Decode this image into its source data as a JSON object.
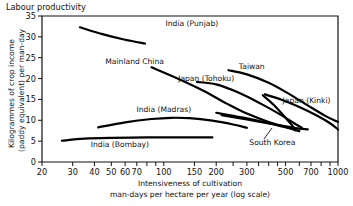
{
  "figure": {
    "top_title": "Labour productivity"
  },
  "chart_data": {
    "type": "line",
    "title": "Labour productivity",
    "xlabel": "Intensiveness of cultivation man-days per hectare per year (log scale)",
    "xlabel_line1": "Intensiveness of cultivation",
    "xlabel_line2": "man-days per hectare per year (log scale)",
    "ylabel": "Kilogrammes of crop income (paddy equivalent) per man-day",
    "ylabel_line1": "Kilogrammes of crop income",
    "ylabel_line2": "(paddy equivalent) per man-day",
    "xscale": "log",
    "xlim": [
      20,
      1000
    ],
    "ylim": [
      0,
      35
    ],
    "grid": false,
    "legend": "inline-labels",
    "xticks": [
      20,
      30,
      40,
      50,
      60,
      70,
      100,
      150,
      200,
      300,
      500,
      700,
      1000
    ],
    "xtick_labels": [
      "20",
      "30",
      "40",
      "50",
      "60",
      "70",
      "100",
      "150",
      "200",
      "300",
      "500",
      "700",
      "1000"
    ],
    "xminor_ticks": [
      80,
      90,
      250,
      350,
      400,
      450,
      600,
      800,
      900
    ],
    "yticks": [
      0,
      5,
      10,
      15,
      20,
      25,
      30,
      35
    ],
    "ytick_labels": [
      "0",
      "5",
      "10",
      "15",
      "20",
      "25",
      "30",
      "35"
    ],
    "series": [
      {
        "name": "India (Punjab)",
        "label": "India (Punjab)",
        "label_x": 145,
        "label_y": 32.5,
        "points": [
          [
            33,
            32.3
          ],
          [
            45,
            30.6
          ],
          [
            60,
            29.3
          ],
          [
            78,
            28.4
          ]
        ]
      },
      {
        "name": "Mainland China",
        "label": "Mainland China",
        "label_x": 68,
        "label_y": 23.4,
        "points": [
          [
            85,
            22.7
          ],
          [
            120,
            20.0
          ],
          [
            170,
            17.0
          ],
          [
            230,
            14.0
          ],
          [
            300,
            11.6
          ],
          [
            400,
            9.6
          ],
          [
            520,
            8.2
          ],
          [
            600,
            7.4
          ]
        ]
      },
      {
        "name": "Japan (Tohoku)",
        "label": "Japan (Tohoku)",
        "label_x": 175,
        "label_y": 19.5,
        "points": [
          [
            155,
            19.2
          ],
          [
            200,
            18.6
          ],
          [
            270,
            16.6
          ],
          [
            360,
            14.0
          ],
          [
            470,
            11.3
          ],
          [
            560,
            9.3
          ],
          [
            620,
            8.2
          ]
        ]
      },
      {
        "name": "Taiwan",
        "label": "Taiwan",
        "label_x": 320,
        "label_y": 22.4,
        "points": [
          [
            235,
            22.0
          ],
          [
            300,
            21.0
          ],
          [
            400,
            19.0
          ],
          [
            520,
            16.4
          ],
          [
            680,
            13.4
          ],
          [
            850,
            11.0
          ],
          [
            1000,
            9.6
          ]
        ]
      },
      {
        "name": "Japan (Kinki)",
        "label": "Japan (Kinki)",
        "label_x": 660,
        "label_y": 14.2,
        "points": [
          [
            380,
            16.2
          ],
          [
            470,
            15.0
          ],
          [
            600,
            13.2
          ],
          [
            760,
            11.1
          ],
          [
            900,
            9.3
          ],
          [
            1000,
            7.8
          ]
        ]
      },
      {
        "name": "South Korea",
        "label": "South Korea",
        "label_x": 420,
        "label_y": 4.1,
        "points": [
          [
            370,
            16.0
          ],
          [
            430,
            13.6
          ],
          [
            490,
            11.0
          ],
          [
            540,
            9.0
          ],
          [
            570,
            7.6
          ]
        ]
      },
      {
        "name": "India (Madras)",
        "label": "India (Madras)",
        "label_x": 100,
        "label_y": 12.0,
        "points": [
          [
            42,
            8.3
          ],
          [
            60,
            9.5
          ],
          [
            85,
            10.3
          ],
          [
            110,
            10.6
          ],
          [
            140,
            10.5
          ],
          [
            190,
            9.9
          ],
          [
            250,
            9.0
          ],
          [
            300,
            8.2
          ]
        ]
      },
      {
        "name": "unlabelled-upper-middle",
        "label": "",
        "label_x": null,
        "label_y": null,
        "points": [
          [
            200,
            11.8
          ],
          [
            280,
            10.7
          ],
          [
            380,
            9.5
          ],
          [
            480,
            8.5
          ],
          [
            560,
            7.8
          ]
        ]
      },
      {
        "name": "unlabelled-lower-middle",
        "label": "",
        "label_x": null,
        "label_y": null,
        "points": [
          [
            215,
            11.2
          ],
          [
            300,
            10.2
          ],
          [
            420,
            9.1
          ],
          [
            560,
            8.2
          ],
          [
            670,
            7.8
          ]
        ]
      },
      {
        "name": "India (Bombay)",
        "label": "India (Bombay)",
        "label_x": 56,
        "label_y": 3.6,
        "points": [
          [
            26,
            5.1
          ],
          [
            35,
            5.6
          ],
          [
            50,
            5.8
          ],
          [
            80,
            5.9
          ],
          [
            120,
            5.9
          ],
          [
            190,
            5.9
          ]
        ]
      }
    ]
  }
}
